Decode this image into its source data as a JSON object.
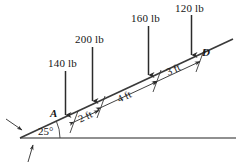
{
  "figure": {
    "type": "engineering-statics-free-body-diagram",
    "incline_angle": "25°",
    "points": {
      "a": "A",
      "d": "D"
    },
    "forces": [
      {
        "id": "load-140",
        "label": "140 lb",
        "magnitude": 140,
        "unit": "lb",
        "direction": "down"
      },
      {
        "id": "load-200",
        "label": "200 lb",
        "magnitude": 200,
        "unit": "lb",
        "direction": "down"
      },
      {
        "id": "load-160",
        "label": "160 lb",
        "magnitude": 160,
        "unit": "lb",
        "direction": "down"
      },
      {
        "id": "load-120",
        "label": "120 lb",
        "magnitude": 120,
        "unit": "lb",
        "direction": "down"
      }
    ],
    "dimensions": [
      {
        "id": "dim-2ft",
        "label": "2 ft",
        "value": 2,
        "unit": "ft"
      },
      {
        "id": "dim-4ft",
        "label": "4 ft",
        "value": 4,
        "unit": "ft"
      },
      {
        "id": "dim-3ft",
        "label": "3 ft",
        "value": 3,
        "unit": "ft"
      }
    ],
    "colors": {
      "line": "#3a3a3a",
      "ground": "#5a5a5a",
      "text": "#151515",
      "background": "#ffffff"
    }
  }
}
